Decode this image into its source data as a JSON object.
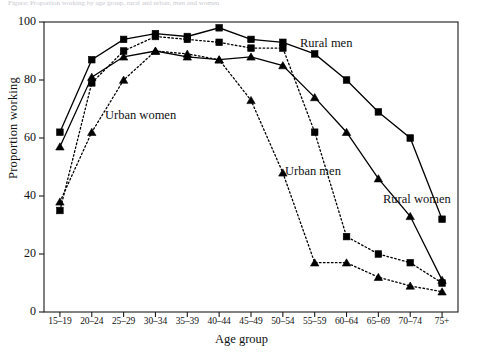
{
  "figure": {
    "cut_off_header": "Figure: Proportion working by age group, rural and urban, men and women",
    "ylabel": "Proportion working",
    "xlabel": "Age group",
    "ytick_labels": [
      "0",
      "20",
      "40",
      "60",
      "80",
      "100"
    ],
    "annotations": [
      {
        "name": "urban-women-label",
        "text": "Urban women",
        "x": 105,
        "y": 108
      },
      {
        "name": "rural-men-label",
        "text": "Rural men",
        "x": 300,
        "y": 36
      },
      {
        "name": "urban-men-label",
        "text": "Urban men",
        "x": 285,
        "y": 164
      },
      {
        "name": "rural-women-label",
        "text": "Rural women",
        "x": 383,
        "y": 192
      }
    ]
  },
  "chart_data": {
    "type": "line",
    "title": "",
    "xlabel": "Age group",
    "ylabel": "Proportion working",
    "ylim": [
      0,
      100
    ],
    "xlim_categories": 13,
    "grid": false,
    "legend": "inline-annotations",
    "categories": [
      "15–19",
      "20–24",
      "25–29",
      "30–34",
      "35–39",
      "40–44",
      "45–49",
      "50–54",
      "55–59",
      "60–64",
      "65–69",
      "70–74",
      "75+"
    ],
    "series": [
      {
        "name": "Rural men",
        "marker": "square",
        "line": "solid",
        "color": "#000000",
        "values": [
          62,
          87,
          94,
          96,
          95,
          98,
          94,
          93,
          89,
          80,
          69,
          60,
          32
        ]
      },
      {
        "name": "Urban men",
        "marker": "square",
        "line": "dotted",
        "color": "#000000",
        "values": [
          35,
          79,
          90,
          95,
          94,
          93,
          91,
          91,
          62,
          26,
          20,
          17,
          10
        ]
      },
      {
        "name": "Rural women",
        "marker": "triangle",
        "line": "solid",
        "color": "#000000",
        "values": [
          57,
          81,
          88,
          90,
          88,
          87,
          88,
          85,
          74,
          62,
          46,
          33,
          11
        ]
      },
      {
        "name": "Urban women",
        "marker": "triangle",
        "line": "dotted",
        "color": "#000000",
        "values": [
          38,
          62,
          80,
          90,
          89,
          87,
          73,
          48,
          17,
          17,
          12,
          9,
          7
        ]
      }
    ]
  }
}
